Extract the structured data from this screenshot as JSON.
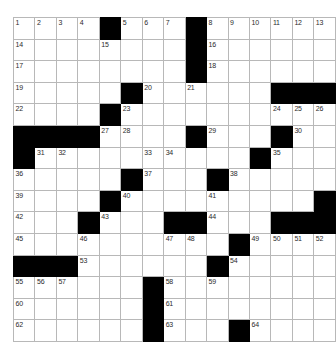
{
  "puzzle": {
    "kind": "crossword-grid",
    "rows": 15,
    "columns": 15,
    "cell_colors": {
      "open": "#ffffff",
      "block": "#000000",
      "gridline": "#b8b8b8",
      "number": "#2b2b2b"
    },
    "grid": [
      [
        "1",
        "2",
        "3",
        "4",
        "#",
        "5",
        "6",
        "7",
        "#",
        "8",
        "9",
        "10",
        "11",
        "12",
        "13"
      ],
      [
        "14",
        "",
        "",
        "",
        "15",
        "",
        "",
        "",
        "#",
        "16",
        "",
        "",
        "",
        "",
        ""
      ],
      [
        "17",
        "",
        "",
        "",
        "",
        "",
        "",
        "",
        "#",
        "18",
        "",
        "",
        "",
        "",
        ""
      ],
      [
        "19",
        "",
        "",
        "",
        "",
        "#",
        "20",
        "",
        "21",
        "",
        "",
        "",
        "#",
        "#",
        "#"
      ],
      [
        "22",
        "",
        "",
        "",
        "#",
        "23",
        "",
        "",
        "",
        "",
        "",
        "",
        "24",
        "25",
        "26"
      ],
      [
        "#",
        "#",
        "#",
        "#",
        "27",
        "28",
        "",
        "",
        "#",
        "29",
        "",
        "",
        "#",
        "30",
        ""
      ],
      [
        "#",
        "31",
        "32",
        "",
        "",
        "",
        "33",
        "34",
        "",
        "",
        "",
        "#",
        "35",
        "",
        ""
      ],
      [
        "36",
        "",
        "",
        "",
        "",
        "#",
        "37",
        "",
        "",
        "#",
        "38",
        "",
        "",
        "",
        ""
      ],
      [
        "39",
        "",
        "",
        "",
        "#",
        "40",
        "",
        "",
        "",
        "41",
        "",
        "",
        "",
        "",
        "#"
      ],
      [
        "42",
        "",
        "",
        "#",
        "43",
        "",
        "",
        "#",
        "#",
        "44",
        "",
        "",
        "#",
        "#",
        "#"
      ],
      [
        "45",
        "",
        "",
        "46",
        "",
        "",
        "",
        "47",
        "48",
        "",
        "#",
        "49",
        "50",
        "51",
        "52"
      ],
      [
        "#",
        "#",
        "#",
        "53",
        "",
        "",
        "",
        "",
        "",
        "#",
        "54",
        "",
        "",
        "",
        ""
      ],
      [
        "55",
        "56",
        "57",
        "",
        "",
        "",
        "#",
        "58",
        "",
        "59",
        "",
        "",
        "",
        "",
        ""
      ],
      [
        "60",
        "",
        "",
        "",
        "",
        "",
        "#",
        "61",
        "",
        "",
        "",
        "",
        "",
        "",
        ""
      ],
      [
        "62",
        "",
        "",
        "",
        "",
        "",
        "#",
        "63",
        "",
        "",
        "#",
        "64",
        "",
        "",
        ""
      ]
    ],
    "numbers": [
      "1",
      "2",
      "3",
      "4",
      "5",
      "6",
      "7",
      "8",
      "9",
      "10",
      "11",
      "12",
      "13",
      "14",
      "15",
      "16",
      "17",
      "18",
      "19",
      "20",
      "21",
      "22",
      "23",
      "24",
      "25",
      "26",
      "27",
      "28",
      "29",
      "30",
      "31",
      "32",
      "33",
      "34",
      "35",
      "36",
      "37",
      "38",
      "39",
      "40",
      "41",
      "42",
      "43",
      "44",
      "45",
      "46",
      "47",
      "48",
      "49",
      "50",
      "51",
      "52",
      "53",
      "54",
      "55",
      "56",
      "57",
      "58",
      "59",
      "60",
      "61",
      "62",
      "63",
      "64"
    ]
  }
}
